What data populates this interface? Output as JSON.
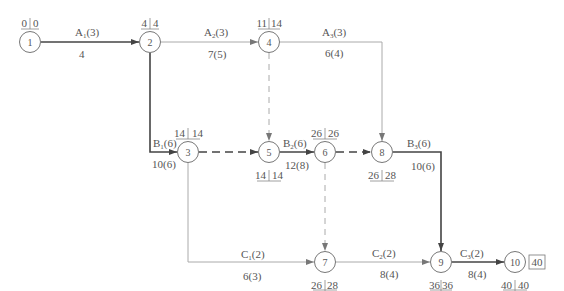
{
  "diagram": {
    "type": "activity-on-arrow network (double-code network diagram)",
    "nodes": [
      {
        "id": "1",
        "x": 30,
        "y": 42,
        "top": [
          "0",
          "0"
        ]
      },
      {
        "id": "2",
        "x": 150,
        "y": 42,
        "top": [
          "4",
          "4"
        ]
      },
      {
        "id": "4",
        "x": 269,
        "y": 42,
        "top": [
          "11",
          "14"
        ]
      },
      {
        "id": "3",
        "x": 188,
        "y": 152,
        "top": [
          "14",
          "14"
        ]
      },
      {
        "id": "5",
        "x": 269,
        "y": 152,
        "bottom": [
          "14",
          "14"
        ]
      },
      {
        "id": "6",
        "x": 325,
        "y": 152,
        "top": [
          "26",
          "26"
        ]
      },
      {
        "id": "8",
        "x": 382,
        "y": 152,
        "bottom": [
          "26",
          "28"
        ]
      },
      {
        "id": "7",
        "x": 325,
        "y": 262,
        "bottom": [
          "26",
          "28"
        ]
      },
      {
        "id": "9",
        "x": 441,
        "y": 262,
        "bottom": [
          "36",
          "36"
        ]
      },
      {
        "id": "10",
        "x": 515,
        "y": 262,
        "bottom": [
          "40",
          "40"
        ],
        "boxed": "40"
      }
    ],
    "edges": [
      {
        "from": "1",
        "to": "2",
        "name": "A",
        "sub": "1",
        "dur": "(3)",
        "below": "4",
        "critical": true
      },
      {
        "from": "2",
        "to": "4",
        "name": "A",
        "sub": "2",
        "dur": "(3)",
        "below": "7(5)",
        "critical": false
      },
      {
        "from": "4",
        "to": "8",
        "name": "A",
        "sub": "3",
        "dur": "(3)",
        "below": "6(4)",
        "critical": false
      },
      {
        "from": "2",
        "to": "3",
        "name": "B",
        "sub": "1",
        "dur": "(6)",
        "below": "10(6)",
        "critical": true
      },
      {
        "from": "3",
        "to": "5",
        "dummy": true,
        "critical": true
      },
      {
        "from": "4",
        "to": "5",
        "dummy": true,
        "critical": false
      },
      {
        "from": "5",
        "to": "6",
        "name": "B",
        "sub": "2",
        "dur": "(6)",
        "below": "12(8)",
        "critical": true
      },
      {
        "from": "6",
        "to": "8",
        "dummy": true,
        "critical": true
      },
      {
        "from": "6",
        "to": "7",
        "dummy": true,
        "critical": false
      },
      {
        "from": "8",
        "to": "9",
        "name": "B",
        "sub": "3",
        "dur": "(6)",
        "below": "10(6)",
        "critical": true
      },
      {
        "from": "3",
        "to": "7",
        "name": "C",
        "sub": "1",
        "dur": "(2)",
        "below": "6(3)",
        "critical": false
      },
      {
        "from": "7",
        "to": "9",
        "name": "C",
        "sub": "2",
        "dur": "(2)",
        "below": "8(4)",
        "critical": false
      },
      {
        "from": "9",
        "to": "10",
        "name": "C",
        "sub": "3",
        "dur": "(2)",
        "below": "8(4)",
        "critical": true
      }
    ]
  },
  "colors": {
    "critical": "#444444",
    "normal": "#9a9a9a",
    "text": "#555555",
    "circle": "#777777"
  },
  "labels": {
    "n1": "1",
    "n2": "2",
    "n3": "3",
    "n4": "4",
    "n5": "5",
    "n6": "6",
    "n7": "7",
    "n8": "8",
    "n9": "9",
    "n10": "10",
    "t1a": "0",
    "t1b": "0",
    "t2a": "4",
    "t2b": "4",
    "t4a": "11",
    "t4b": "14",
    "t3a": "14",
    "t3b": "14",
    "t6a": "26",
    "t6b": "26",
    "b5a": "14",
    "b5b": "14",
    "b8a": "26",
    "b8b": "28",
    "b7a": "26",
    "b7b": "28",
    "b9a": "36",
    "b9b": "36",
    "b10a": "40",
    "b10b": "40",
    "box10": "40",
    "e12_name": "A",
    "e12_sub": "1",
    "e12_dur": "(3)",
    "e12_below": "4",
    "e24_name": "A",
    "e24_sub": "2",
    "e24_dur": "(3)",
    "e24_below": "7(5)",
    "e48_name": "A",
    "e48_sub": "3",
    "e48_dur": "(3)",
    "e48_below": "6(4)",
    "e23_name": "B",
    "e23_sub": "1",
    "e23_dur": "(6)",
    "e23_below": "10(6)",
    "e56_name": "B",
    "e56_sub": "2",
    "e56_dur": "(6)",
    "e56_below": "12(8)",
    "e89_name": "B",
    "e89_sub": "3",
    "e89_dur": "(6)",
    "e89_below": "10(6)",
    "e37_name": "C",
    "e37_sub": "1",
    "e37_dur": "(2)",
    "e37_below": "6(3)",
    "e79_name": "C",
    "e79_sub": "2",
    "e79_dur": "(2)",
    "e79_below": "8(4)",
    "e910_name": "C",
    "e910_sub": "3",
    "e910_dur": "(2)",
    "e910_below": "8(4)"
  }
}
